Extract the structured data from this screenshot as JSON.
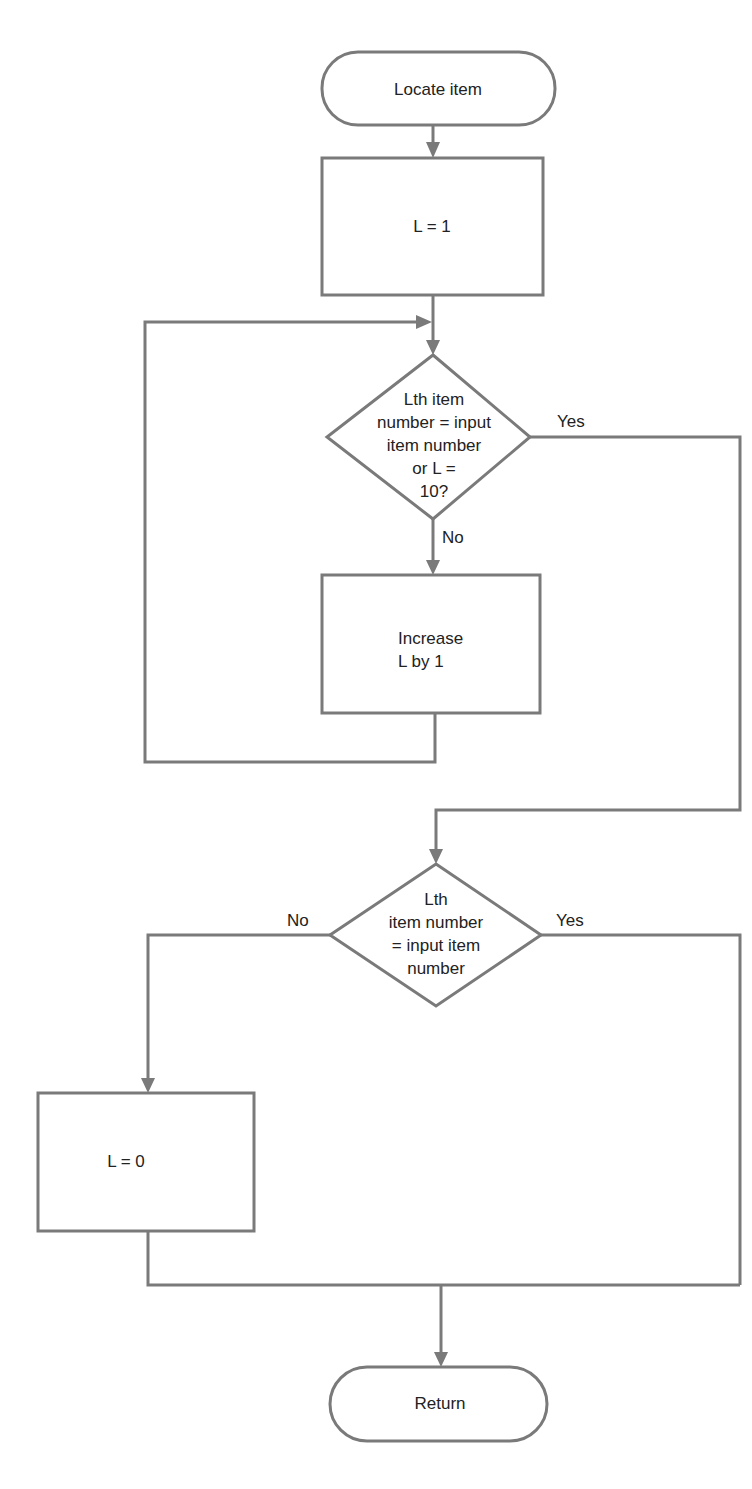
{
  "diagram": {
    "type": "flowchart",
    "colors": {
      "stroke": "#7a7a7a",
      "text": "#222222",
      "background": "#ffffff"
    },
    "nodes": {
      "start": {
        "kind": "terminal",
        "label": "Locate item"
      },
      "init": {
        "kind": "process",
        "label": "L = 1"
      },
      "decision1": {
        "kind": "decision",
        "lines": [
          "Lth item",
          "number = input",
          "item number",
          "or L =",
          "10?"
        ]
      },
      "increment": {
        "kind": "process",
        "lines": [
          "Increase",
          "L by 1"
        ]
      },
      "decision2": {
        "kind": "decision",
        "lines": [
          "Lth",
          "item number",
          "= input item",
          "number"
        ]
      },
      "notfound": {
        "kind": "process",
        "label": "L = 0"
      },
      "end": {
        "kind": "terminal",
        "label": "Return"
      }
    },
    "edge_labels": {
      "d1_yes": "Yes",
      "d1_no": "No",
      "d2_no": "No",
      "d2_yes": "Yes"
    },
    "edges": [
      {
        "from": "start",
        "to": "init"
      },
      {
        "from": "init",
        "to": "decision1"
      },
      {
        "from": "decision1",
        "to": "increment",
        "label": "No"
      },
      {
        "from": "increment",
        "to": "decision1",
        "note": "loop back"
      },
      {
        "from": "decision1",
        "to": "decision2",
        "label": "Yes"
      },
      {
        "from": "decision2",
        "to": "notfound",
        "label": "No"
      },
      {
        "from": "decision2",
        "to": "end",
        "label": "Yes"
      },
      {
        "from": "notfound",
        "to": "end"
      }
    ]
  }
}
